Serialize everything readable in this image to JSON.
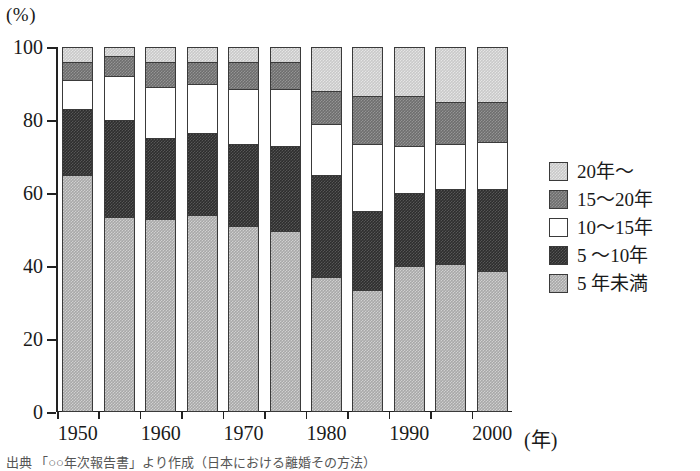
{
  "axes": {
    "y_unit": "(%)",
    "x_unit": "(年)",
    "y_ticks": [
      "0",
      "20",
      "40",
      "60",
      "80",
      "100"
    ],
    "x_ticks": [
      "1950",
      "1960",
      "1970",
      "1980",
      "1990",
      "2000"
    ]
  },
  "legend": {
    "items": [
      {
        "label": "20年～",
        "fill": "#c9c9c9",
        "key": "f-lt"
      },
      {
        "label": "15～20年",
        "fill": "#6e6e6e",
        "key": "f-mid"
      },
      {
        "label": "10～15年",
        "fill": "#ffffff",
        "key": "f-white"
      },
      {
        "label": "5 ～10年",
        "fill": "#2e2e2e",
        "key": "f-dark"
      },
      {
        "label": "5 年未満",
        "fill": "#a8a8a8",
        "key": "f-gray"
      }
    ]
  },
  "caption": {
    "text": "出典  「○○年次報告書」より作成（日本における離婚その方法）"
  },
  "chart_data": {
    "type": "bar",
    "title": "",
    "subtitle": "",
    "xlabel": "(年)",
    "ylabel": "(%)",
    "ylim": [
      0,
      100
    ],
    "xlim_labels": [
      "1950",
      "1960",
      "1970",
      "1980",
      "1990",
      "2000"
    ],
    "grid": false,
    "stacked": true,
    "normalized_to_100": true,
    "legend_position": "right",
    "categories": [
      "1950",
      "1955",
      "1960",
      "1965",
      "1970",
      "1975",
      "1980",
      "1985",
      "1990",
      "1995",
      "2000"
    ],
    "series": [
      {
        "name": "5年未満",
        "fill": "#a8a8a8",
        "values": [
          65,
          53.5,
          53,
          54,
          51,
          49.5,
          37,
          33.5,
          40,
          40.5,
          38.5
        ]
      },
      {
        "name": "5～10年",
        "fill": "#2e2e2e",
        "values": [
          18,
          26.5,
          22,
          22.5,
          22.5,
          23.5,
          28,
          21.5,
          20,
          20.5,
          22.5
        ]
      },
      {
        "name": "10～15年",
        "fill": "#ffffff",
        "values": [
          8,
          12,
          14,
          13.5,
          15,
          15.5,
          14,
          18.5,
          13,
          12.5,
          13
        ]
      },
      {
        "name": "15～20年",
        "fill": "#6e6e6e",
        "values": [
          5,
          5.5,
          7,
          6,
          7.5,
          7.5,
          9,
          13,
          13.5,
          11.5,
          11
        ]
      },
      {
        "name": "20年～",
        "fill": "#c9c9c9",
        "values": [
          4,
          2.5,
          4,
          4,
          4,
          4,
          12,
          13.5,
          13.5,
          15,
          15
        ]
      }
    ]
  }
}
